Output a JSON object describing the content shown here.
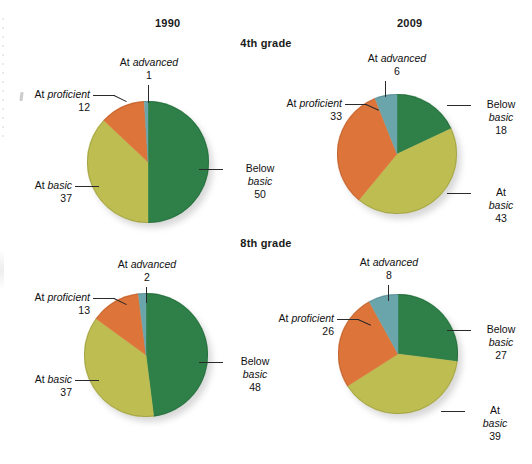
{
  "figure": {
    "column_headers": [
      "1990",
      "2009"
    ],
    "row_headers": [
      "4th grade",
      "8th grade"
    ]
  },
  "colors": {
    "below_basic": "#2e8048",
    "at_basic": "#bdbd52",
    "at_proficient": "#dd7439",
    "at_advanced": "#6ba5ac",
    "text": "#111111",
    "leader": "#2a2a2a",
    "background": "#ffffff"
  },
  "labels": {
    "below_basic_line1": "Below",
    "below_basic_line2": "basic",
    "at_basic_line1": "At",
    "at_basic_line2": "basic",
    "at_basic_inline": "At basic",
    "at_proficient": "At proficient",
    "at_advanced": "At advanced"
  },
  "chart_data": [
    {
      "type": "pie",
      "title": "1990",
      "subtitle": "4th grade",
      "categories": [
        "Below basic",
        "At basic",
        "At proficient",
        "At advanced"
      ],
      "values": [
        50,
        37,
        12,
        1
      ],
      "colors": [
        "#2e8048",
        "#bdbd52",
        "#dd7439",
        "#6ba5ac"
      ],
      "start_angle_deg": 0,
      "direction": "clockwise",
      "units": "percent"
    },
    {
      "type": "pie",
      "title": "2009",
      "subtitle": "4th grade",
      "categories": [
        "Below basic",
        "At basic",
        "At proficient",
        "At advanced"
      ],
      "values": [
        18,
        43,
        33,
        6
      ],
      "colors": [
        "#2e8048",
        "#bdbd52",
        "#dd7439",
        "#6ba5ac"
      ],
      "start_angle_deg": 0,
      "direction": "clockwise",
      "units": "percent"
    },
    {
      "type": "pie",
      "title": "1990",
      "subtitle": "8th grade",
      "categories": [
        "Below basic",
        "At basic",
        "At proficient",
        "At advanced"
      ],
      "values": [
        48,
        37,
        13,
        2
      ],
      "colors": [
        "#2e8048",
        "#bdbd52",
        "#dd7439",
        "#6ba5ac"
      ],
      "start_angle_deg": 0,
      "direction": "clockwise",
      "units": "percent"
    },
    {
      "type": "pie",
      "title": "2009",
      "subtitle": "8th grade",
      "categories": [
        "Below basic",
        "At basic",
        "At proficient",
        "At advanced"
      ],
      "values": [
        27,
        39,
        26,
        8
      ],
      "colors": [
        "#2e8048",
        "#bdbd52",
        "#dd7439",
        "#6ba5ac"
      ],
      "start_angle_deg": 0,
      "direction": "clockwise",
      "units": "percent"
    }
  ],
  "charts": {
    "g4_1990": {
      "below_basic": "50",
      "at_basic": "37",
      "at_proficient": "12",
      "at_advanced": "1"
    },
    "g4_2009": {
      "below_basic": "18",
      "at_basic": "43",
      "at_proficient": "33",
      "at_advanced": "6"
    },
    "g8_1990": {
      "below_basic": "48",
      "at_basic": "37",
      "at_proficient": "13",
      "at_advanced": "2"
    },
    "g8_2009": {
      "below_basic": "27",
      "at_basic": "39",
      "at_proficient": "26",
      "at_advanced": "8"
    }
  }
}
